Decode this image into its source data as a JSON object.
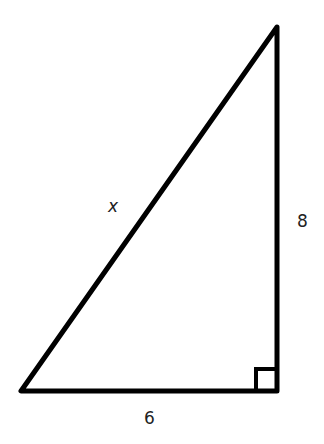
{
  "diagram": {
    "type": "right-triangle",
    "labels": {
      "hypotenuse": "x",
      "vertical_leg": "8",
      "horizontal_leg": "6"
    },
    "right_angle_marker": true,
    "stroke_color": "#000000",
    "text_color": "#222222"
  }
}
